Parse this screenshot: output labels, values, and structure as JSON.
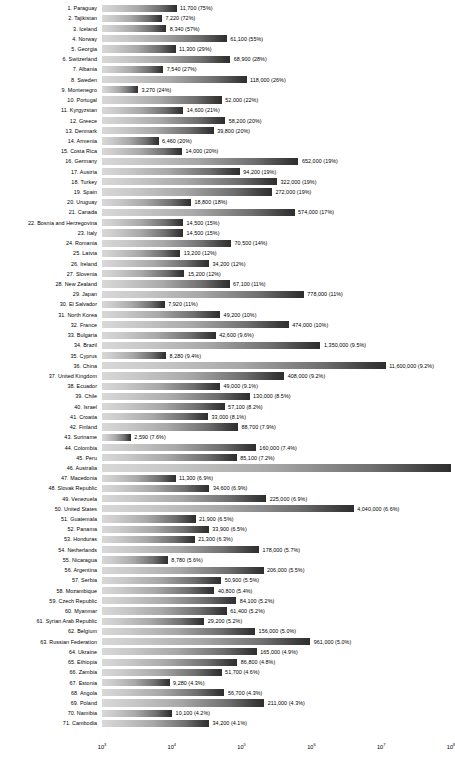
{
  "chart_data": {
    "type": "bar",
    "orientation": "horizontal",
    "title": "",
    "xlabel": "",
    "ylabel": "",
    "xscale": "log",
    "xlim": [
      1000,
      100000000
    ],
    "grid": false,
    "legend": null,
    "xticks": [
      "10³",
      "10⁴",
      "10⁵",
      "10⁶",
      "10⁷",
      "10⁸"
    ],
    "xtick_exponents": [
      3,
      4,
      5,
      6,
      7,
      8
    ],
    "categories": [
      "1. Paraguay",
      "2. Tajikistan",
      "3. Iceland",
      "4. Norway",
      "5. Georgia",
      "6. Switzerland",
      "7. Albania",
      "8. Sweden",
      "9. Montenegro",
      "10. Portugal",
      "11. Kyrgyzstan",
      "12. Greece",
      "13. Denmark",
      "14. Armenia",
      "15. Costa Rica",
      "16. Germany",
      "17. Austria",
      "18. Turkey",
      "19. Spain",
      "20. Uruguay",
      "21. Canada",
      "22. Bosnia and Herzegovina",
      "23. Italy",
      "24. Romania",
      "25. Latvia",
      "26. Ireland",
      "27. Slovenia",
      "28. New Zealand",
      "29. Japan",
      "30. El Salvador",
      "31. North Korea",
      "32. France",
      "33. Bulgaria",
      "34. Brazil",
      "35. Cyprus",
      "36. China",
      "37. United Kingdom",
      "38. Ecuador",
      "39. Chile",
      "40. Israel",
      "41. Croatia",
      "42. Finland",
      "43. Suriname",
      "44. Colombia",
      "45. Peru",
      "46. Australia",
      "47. Macedonia",
      "48. Slovak Republic",
      "49. Venezuela",
      "50. United States",
      "51. Guatemala",
      "52. Panama",
      "53. Honduras",
      "54. Netherlands",
      "55. Nicaragua",
      "56. Argentina",
      "57. Serbia",
      "58. Mozambique",
      "59. Czech Republic",
      "60. Myanmar",
      "61. Syrian Arab Republic",
      "62. Belgium",
      "63. Russian Federation",
      "64. Ukraine",
      "65. Ethiopia",
      "66. Zambia",
      "67. Estonia",
      "68. Angola",
      "69. Poland",
      "70. Namibia",
      "71. Cambodia"
    ],
    "values": [
      11700,
      7220,
      8340,
      61100,
      11300,
      68900,
      7540,
      118000,
      3270,
      52000,
      14600,
      58200,
      39800,
      6460,
      14000,
      652000,
      94200,
      322000,
      272000,
      18800,
      574000,
      14500,
      14500,
      70500,
      13200,
      34200,
      15200,
      67100,
      778000,
      7920,
      49200,
      474000,
      42600,
      1350000,
      8280,
      11600000,
      408000,
      49000,
      130000,
      57100,
      33000,
      88700,
      2590,
      160000,
      85100,
      null,
      11300,
      34600,
      225000,
      4040000,
      21900,
      33900,
      21300,
      178000,
      8780,
      206000,
      50900,
      40800,
      84100,
      61400,
      29200,
      156000,
      961000,
      165000,
      86800,
      51700,
      9280,
      56700,
      211000,
      10100,
      34200
    ],
    "percents": [
      "75%",
      "72%",
      "57%",
      "55%",
      "29%",
      "28%",
      "27%",
      "26%",
      "24%",
      "22%",
      "21%",
      "20%",
      "20%",
      "20%",
      "20%",
      "19%",
      "19%",
      "19%",
      "19%",
      "18%",
      "17%",
      "15%",
      "15%",
      "14%",
      "12%",
      "12%",
      "12%",
      "11%",
      "11%",
      "11%",
      "10%",
      "10%",
      "9.6%",
      "9.5%",
      "9.4%",
      "9.2%",
      "9.2%",
      "9.1%",
      "8.5%",
      "8.2%",
      "8.1%",
      "7.9%",
      "7.6%",
      "7.4%",
      "7.2%",
      null,
      "6.9%",
      "6.9%",
      "6.9%",
      "6.6%",
      "6.5%",
      "6.5%",
      "6.3%",
      "5.7%",
      "5.6%",
      "5.5%",
      "5.5%",
      "5.4%",
      "5.2%",
      "5.2%",
      "5.2%",
      "5.0%",
      "5.0%",
      "4.9%",
      "4.8%",
      "4.6%",
      "4.3%",
      "4.3%",
      "4.3%",
      "4.2%",
      "4.1%"
    ],
    "labels": [
      "11,700 (75%)",
      "7,220 (72%)",
      "8,340 (57%)",
      "61,100 (55%)",
      "11,300 (29%)",
      "68,900 (28%)",
      "7,540 (27%)",
      "118,000 (26%)",
      "3,270 (24%)",
      "52,000 (22%)",
      "14,600 (21%)",
      "58,200 (20%)",
      "39,800 (20%)",
      "6,460 (20%)",
      "14,000 (20%)",
      "652,000 (19%)",
      "94,200 (19%)",
      "322,000 (19%)",
      "272,000 (19%)",
      "18,800 (18%)",
      "574,000 (17%)",
      "14,500 (15%)",
      "14,500 (15%)",
      "70,500 (14%)",
      "13,200 (12%)",
      "34,200 (12%)",
      "15,200 (12%)",
      "67,100 (11%)",
      "778,000 (11%)",
      "7,920 (11%)",
      "49,200 (10%)",
      "474,000 (10%)",
      "42,600 (9.6%)",
      "1,350,000 (9.5%)",
      "8,280 (9.4%)",
      "11,600,000 (9.2%)",
      "408,000 (9.2%)",
      "49,000 (9.1%)",
      "130,000 (8.5%)",
      "57,100 (8.2%)",
      "33,000 (8.1%)",
      "88,700 (7.9%)",
      "2,590 (7.6%)",
      "160,000 (7.4%)",
      "85,100 (7.2%)",
      "",
      "11,300 (6.9%)",
      "34,600 (6.9%)",
      "225,000 (6.9%)",
      "4,040,000 (6.6%)",
      "21,900 (6.5%)",
      "33,900 (6.5%)",
      "21,300 (6.3%)",
      "178,000 (5.7%)",
      "8,780 (5.6%)",
      "206,000 (5.5%)",
      "50,900 (5.5%)",
      "40,800 (5.4%)",
      "84,100 (5.2%)",
      "61,400 (5.2%)",
      "29,200 (5.2%)",
      "156,000 (5.0%)",
      "961,000 (5.0%)",
      "165,000 (4.9%)",
      "86,800 (4.8%)",
      "51,700 (4.6%)",
      "9,280 (4.3%)",
      "56,700 (4.3%)",
      "211,000 (4.3%)",
      "10,100 (4.2%)",
      "34,200 (4.1%)"
    ]
  },
  "style": {
    "bar_gradient_start": "#d8d8d8",
    "bar_gradient_end": "#2e2e2e",
    "text_color": "#000000",
    "background": "#ffffff"
  }
}
